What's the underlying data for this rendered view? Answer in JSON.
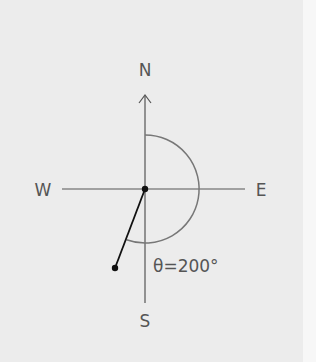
{
  "diagram": {
    "type": "compass-bearing",
    "labels": {
      "north": "N",
      "south": "S",
      "east": "E",
      "west": "W"
    },
    "angle_label": "θ=200°",
    "angle_degrees": 200,
    "colors": {
      "background": "#ececec",
      "axes": "#555555",
      "arc": "#777777",
      "vector": "#111111"
    }
  }
}
